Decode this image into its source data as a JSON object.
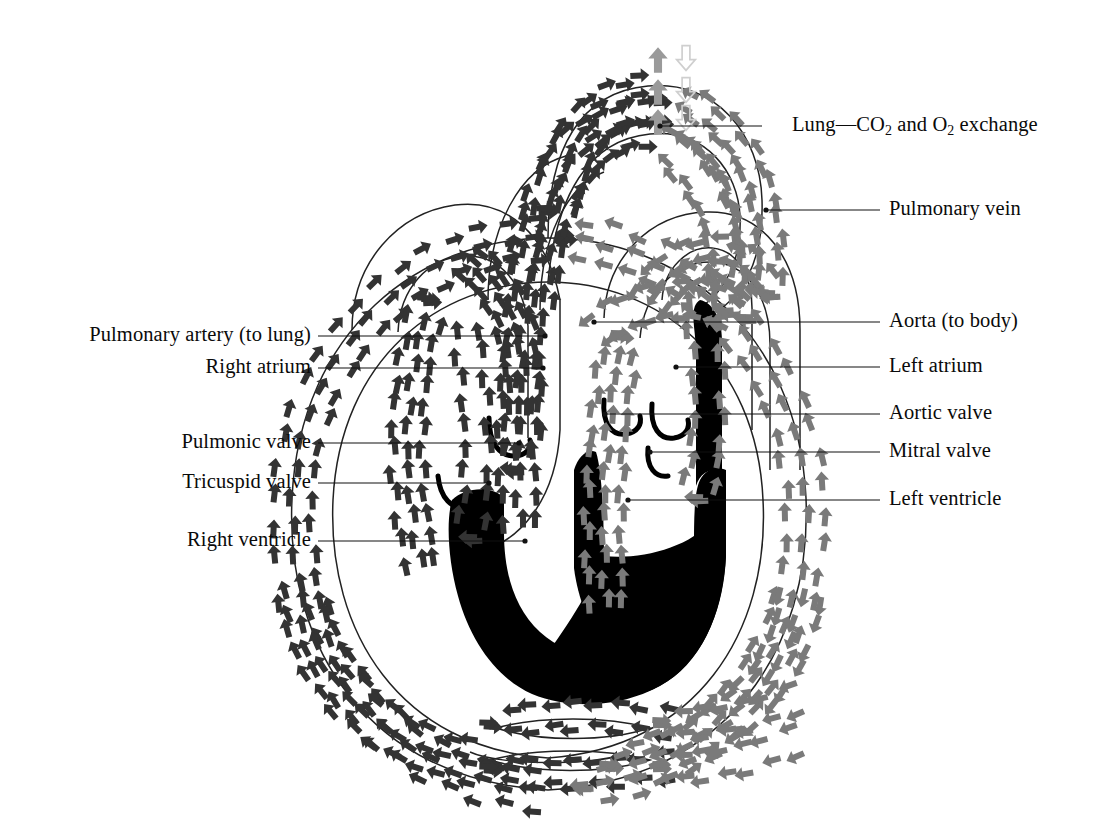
{
  "diagram": {
    "type": "anatomical-flow-diagram",
    "background_color": "#ffffff",
    "colors": {
      "deoxygenated_arrow": "#333333",
      "oxygenated_arrow": "#7a7a7a",
      "gas_exchange_o2_in": "#9a9a9a",
      "gas_exchange_co2_out": "#d8d8d8",
      "myocardium": "#000000",
      "vessel_outline": "#222222",
      "leader_line": "#111111",
      "text": "#0a0a0a"
    }
  },
  "labels": {
    "right": [
      {
        "id": "lung",
        "text_before": "Lung—CO",
        "sub1": "2",
        "text_mid": " and O",
        "sub2": "2",
        "text_after": " exchange",
        "has_subscripts": true,
        "x": 792,
        "y": 126,
        "leader_x1": 762,
        "leader_x2": 660,
        "dot_x": 660
      },
      {
        "id": "pulmonary-vein",
        "label": "Pulmonary vein",
        "x": 889,
        "y": 210,
        "leader_x1": 880,
        "leader_x2": 766,
        "dot_x": 766
      },
      {
        "id": "aorta",
        "label": "Aorta (to body)",
        "x": 889,
        "y": 322,
        "leader_x1": 880,
        "leader_x2": 594,
        "dot_x": 594
      },
      {
        "id": "left-atrium",
        "label": "Left atrium",
        "x": 889,
        "y": 367,
        "leader_x1": 880,
        "leader_x2": 676,
        "dot_x": 676
      },
      {
        "id": "aortic-valve",
        "label": "Aortic valve",
        "x": 889,
        "y": 414,
        "leader_x1": 880,
        "leader_x2": 605,
        "dot_x": 605
      },
      {
        "id": "mitral-valve",
        "label": "Mitral valve",
        "x": 889,
        "y": 452,
        "leader_x1": 880,
        "leader_x2": 650,
        "dot_x": 650
      },
      {
        "id": "left-ventricle",
        "label": "Left ventricle",
        "x": 889,
        "y": 500,
        "leader_x1": 880,
        "leader_x2": 628,
        "dot_x": 628
      }
    ],
    "left": [
      {
        "id": "pulmonary-artery",
        "label": "Pulmonary artery (to lung)",
        "x": 311,
        "y": 336,
        "leader_x1": 318,
        "leader_x2": 545,
        "dot_x": 545
      },
      {
        "id": "right-atrium",
        "label": "Right atrium",
        "x": 311,
        "y": 368,
        "leader_x1": 318,
        "leader_x2": 543,
        "dot_x": 543
      },
      {
        "id": "pulmonic-valve",
        "label": "Pulmonic valve",
        "x": 311,
        "y": 443,
        "leader_x1": 318,
        "leader_x2": 519,
        "dot_x": 519
      },
      {
        "id": "tricuspid-valve",
        "label": "Tricuspid valve",
        "x": 311,
        "y": 483,
        "leader_x1": 318,
        "leader_x2": 489,
        "dot_x": 489
      },
      {
        "id": "right-ventricle",
        "label": "Right ventricle",
        "x": 311,
        "y": 541,
        "leader_x1": 318,
        "leader_x2": 525,
        "dot_x": 525
      }
    ]
  },
  "flow_paths": [
    {
      "id": "systemic-venous-return",
      "name": "Systemic venous return (body → right atrium)",
      "blood": "deoxygenated",
      "color": "#333333",
      "direction": "upward along left outer band"
    },
    {
      "id": "right-heart-to-lung",
      "name": "Pulmonary artery (right ventricle → lung)",
      "blood": "deoxygenated",
      "color": "#333333",
      "direction": "up and over the top arch"
    },
    {
      "id": "lung-gas-exchange",
      "name": "Lung — CO2 and O2 exchange",
      "blood": "exchange",
      "color": "#9a9a9a",
      "direction": "O2 in (up), CO2 out (down)"
    },
    {
      "id": "pulmonary-vein-return",
      "name": "Pulmonary vein (lung → left atrium)",
      "blood": "oxygenated",
      "color": "#7a7a7a",
      "direction": "downward into left heart"
    },
    {
      "id": "aorta-to-body",
      "name": "Aorta (left ventricle → body)",
      "blood": "oxygenated",
      "color": "#7a7a7a",
      "direction": "downward along right outer band"
    },
    {
      "id": "capillary-bed",
      "name": "Body capillary bed (bottom)",
      "blood": "exchange",
      "color": "#555555",
      "direction": "right to left across bottom"
    }
  ]
}
